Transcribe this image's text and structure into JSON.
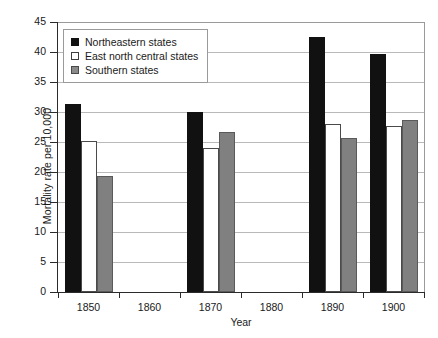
{
  "chart_data": {
    "type": "bar",
    "title": "",
    "subtitle": "",
    "xlabel": "Year",
    "ylabel": "Mortality rate per 10,000",
    "categories": [
      "1850",
      "1860",
      "1870",
      "1880",
      "1890",
      "1900"
    ],
    "ylim": [
      0,
      45
    ],
    "ytick_values": [
      0,
      5,
      10,
      15,
      20,
      25,
      30,
      35,
      40,
      45
    ],
    "ytick_labels": [
      "0",
      "5",
      "10",
      "15",
      "20",
      "25",
      "30",
      "35",
      "40",
      "45"
    ],
    "grid": "horizontal",
    "legend_position": "upper-left-inside",
    "series": [
      {
        "name": "Northeastern states",
        "color": "#111111",
        "style": "solid-black",
        "values": [
          31.4,
          null,
          30.0,
          null,
          42.5,
          39.7
        ]
      },
      {
        "name": "East north central states",
        "color": "#ffffff",
        "style": "white-outlined",
        "values": [
          25.2,
          null,
          24.0,
          null,
          28.0,
          27.7
        ]
      },
      {
        "name": "Southern states",
        "color": "#808080",
        "style": "solid-gray",
        "values": [
          19.3,
          null,
          26.7,
          null,
          25.6,
          28.7
        ]
      }
    ]
  }
}
